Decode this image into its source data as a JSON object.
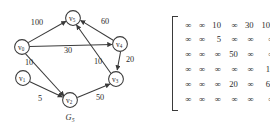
{
  "figure": {
    "caption": "G",
    "caption_subscript": "5",
    "kind": "weighted-directed-graph-with-cost-adjacency-matrix"
  },
  "graph": {
    "nodes": [
      {
        "id": "v0",
        "label": "v",
        "subscript": "0",
        "cx": 22,
        "cy": 47
      },
      {
        "id": "v1",
        "label": "v",
        "subscript": "1",
        "cx": 23,
        "cy": 78
      },
      {
        "id": "v2",
        "label": "v",
        "subscript": "2",
        "cx": 70,
        "cy": 100
      },
      {
        "id": "v3",
        "label": "v",
        "subscript": "3",
        "cx": 116,
        "cy": 79
      },
      {
        "id": "v4",
        "label": "v",
        "subscript": "4",
        "cx": 120,
        "cy": 44
      },
      {
        "id": "v5",
        "label": "v",
        "subscript": "5",
        "cx": 73,
        "cy": 18
      }
    ],
    "node_radius": 7.4,
    "edges": [
      {
        "from": "v0",
        "to": "v5",
        "weight": "100",
        "label_x": 37,
        "label_y": 25
      },
      {
        "from": "v0",
        "to": "v4",
        "weight": "30",
        "label_x": 68,
        "label_y": 53
      },
      {
        "from": "v0",
        "to": "v2",
        "weight": "10",
        "label_x": 29,
        "label_y": 65
      },
      {
        "from": "v1",
        "to": "v2",
        "weight": "5",
        "label_x": 40,
        "label_y": 101
      },
      {
        "from": "v2",
        "to": "v3",
        "weight": "50",
        "label_x": 100,
        "label_y": 100
      },
      {
        "from": "v3",
        "to": "v5",
        "weight": "10",
        "label_x": 98,
        "label_y": 64
      },
      {
        "from": "v4",
        "to": "v5",
        "weight": "60",
        "label_x": 105,
        "label_y": 24
      },
      {
        "from": "v4",
        "to": "v3",
        "weight": "20",
        "label_x": 130,
        "label_y": 62
      }
    ]
  },
  "matrix": {
    "infinity_symbol": "∞",
    "rows": [
      [
        "∞",
        "∞",
        "10",
        "∞",
        "30",
        "100"
      ],
      [
        "∞",
        "∞",
        "5",
        "∞",
        "∞",
        "∞"
      ],
      [
        "∞",
        "∞",
        "∞",
        "50",
        "∞",
        "∞"
      ],
      [
        "∞",
        "∞",
        "∞",
        "∞",
        "∞",
        "10"
      ],
      [
        "∞",
        "∞",
        "∞",
        "20",
        "∞",
        "60"
      ],
      [
        "∞",
        "∞",
        "∞",
        "∞",
        "∞",
        "∞"
      ]
    ]
  },
  "colors": {
    "ink": "#2b2b2b",
    "stroke": "#3a3a3a",
    "background": "#ffffff"
  }
}
